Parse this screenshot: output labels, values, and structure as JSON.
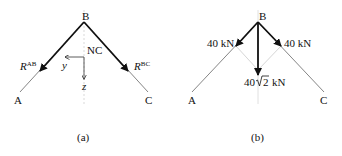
{
  "panel_a": {
    "caption": "(a)",
    "node_top": "B",
    "node_left": "A",
    "node_right": "C",
    "axis_origin_label": "NC",
    "axis_y": "y",
    "axis_z": "z",
    "force_left": {
      "symbol": "R",
      "superscript": "AB"
    },
    "force_right": {
      "symbol": "R",
      "superscript": "BC"
    }
  },
  "panel_b": {
    "caption": "(b)",
    "node_top": "B",
    "node_left": "A",
    "node_right": "C",
    "force_left": "40 kN",
    "force_right": "40 kN",
    "resultant_prefix": "40",
    "resultant_radicand": "2",
    "resultant_unit": "kN"
  },
  "colors": {
    "member": "#777777",
    "force": "#111111",
    "guide": "#d0d0d0"
  }
}
